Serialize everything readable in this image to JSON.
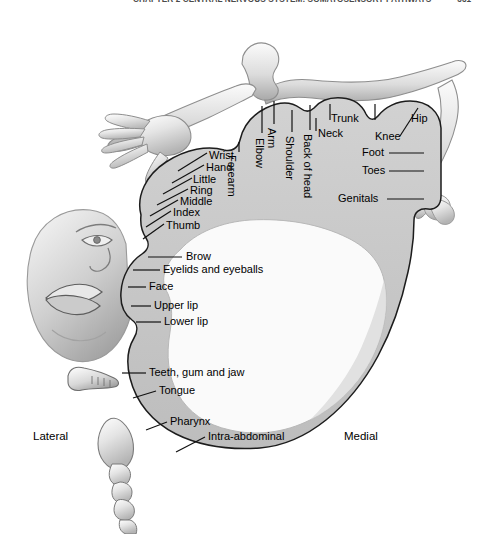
{
  "page": {
    "header_text": "CHAPTER 2  CENTRAL NERVOUS SYSTEM: SOMATOSENSORY PATHWAYS",
    "page_number": "331",
    "background_color": "#ffffff"
  },
  "figure": {
    "name": "sensory-homunculus",
    "cortex_band_color": "#c9c9c9",
    "cortex_interior_color": "#f7f7f7",
    "outline_color": "#1a1a1a",
    "body_figure_color": "#dcdcdc",
    "orientation": {
      "left_label": "Lateral",
      "right_label": "Medial"
    }
  },
  "labels": {
    "hand_group": [
      {
        "text": "Wrist",
        "x": 209,
        "y": 156
      },
      {
        "text": "Hand",
        "x": 206,
        "y": 168
      },
      {
        "text": "Little",
        "x": 193,
        "y": 180
      },
      {
        "text": "Ring",
        "x": 190,
        "y": 191
      },
      {
        "text": "Middle",
        "x": 180,
        "y": 202
      },
      {
        "text": "Index",
        "x": 173,
        "y": 213
      },
      {
        "text": "Thumb",
        "x": 166,
        "y": 226
      }
    ],
    "vertical_group": [
      {
        "text": "Forearm",
        "x": 237,
        "y": 155
      },
      {
        "text": "Elbow",
        "x": 265,
        "y": 118
      },
      {
        "text": "Arm",
        "x": 277,
        "y": 112
      },
      {
        "text": "Shoulder",
        "x": 295,
        "y": 125
      },
      {
        "text": "Back of head",
        "x": 313,
        "y": 117
      }
    ],
    "upper_group": [
      {
        "text": "Neck",
        "x": 318,
        "y": 128
      },
      {
        "text": "Trunk",
        "x": 331,
        "y": 113
      },
      {
        "text": "Hip",
        "x": 415,
        "y": 113
      },
      {
        "text": "Knee",
        "x": 397,
        "y": 131
      }
    ],
    "right_group": [
      {
        "text": "Foot",
        "x": 365,
        "y": 150
      },
      {
        "text": "Toes",
        "x": 365,
        "y": 168
      },
      {
        "text": "Genitals",
        "x": 341,
        "y": 196
      }
    ],
    "face_group": [
      {
        "text": "Brow",
        "x": 186,
        "y": 254
      },
      {
        "text": "Eyelids and eyeballs",
        "x": 163,
        "y": 267
      },
      {
        "text": "Face",
        "x": 149,
        "y": 284
      },
      {
        "text": "Upper lip",
        "x": 154,
        "y": 303
      },
      {
        "text": "Lower lip",
        "x": 164,
        "y": 319
      }
    ],
    "mouth_group": [
      {
        "text": "Teeth, gum and jaw",
        "x": 149,
        "y": 370
      },
      {
        "text": "Tongue",
        "x": 159,
        "y": 388
      },
      {
        "text": "Pharynx",
        "x": 170,
        "y": 419
      },
      {
        "text": "Intra-abdominal",
        "x": 208,
        "y": 434
      }
    ],
    "orientation_group": [
      {
        "text": "Lateral",
        "x": 33,
        "y": 434
      },
      {
        "text": "Medial",
        "x": 344,
        "y": 434
      }
    ]
  },
  "diagram_data": {
    "type": "anatomical-diagram",
    "subject": "Somatosensory cortex homunculus map",
    "regions_medial_to_lateral": [
      "Genitals",
      "Toes",
      "Foot",
      "Knee",
      "Hip",
      "Trunk",
      "Neck",
      "Back of head",
      "Shoulder",
      "Arm",
      "Elbow",
      "Forearm",
      "Wrist",
      "Hand",
      "Little",
      "Ring",
      "Middle",
      "Index",
      "Thumb",
      "Brow",
      "Eyelids and eyeballs",
      "Face",
      "Upper lip",
      "Lower lip",
      "Teeth, gum and jaw",
      "Tongue",
      "Pharynx",
      "Intra-abdominal"
    ],
    "enlarged_representations": [
      "Hand",
      "Fingers",
      "Face",
      "Lips",
      "Tongue"
    ],
    "illustration_elements": [
      "homunculus-body-figure",
      "oversized-hand",
      "oversized-face",
      "jaw-teeth-inset",
      "tongue-pharynx-inset",
      "leg-foot",
      "genitals"
    ]
  }
}
